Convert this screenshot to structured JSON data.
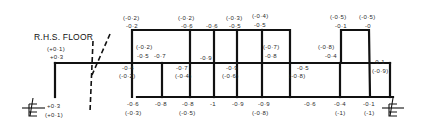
{
  "diagram": {
    "title": "R.H.S. FLOOR",
    "centerline_symbol": "℄",
    "centerline_icons": [
      "left-centerline",
      "right-centerline"
    ],
    "labels": {
      "left_top_paren": "(+0·1)",
      "left_top": "+0·3",
      "left_bottom": "+0·3",
      "left_bottom_paren": "(+0·1)",
      "bay1_top_paren": "(-0·2)",
      "bay1_top": "-0·2",
      "bay1_inner_paren": "(-0·2)",
      "bay1_inner_a": "-0·5",
      "bay1_inner_b": "-0·7",
      "bay1_mid": "-0·4",
      "bay1_mid_paren": "(-0·2)",
      "bay2_top_paren": "(-0·2)",
      "bay2_top": "-0·6",
      "bay2_mid": "-0·7",
      "bay2_mid_paren": "(-0·4)",
      "bay2_inner": "-0·9",
      "bay3_top_paren": "(-0·3)",
      "bay3_top": "-0·5",
      "bay3_top_b": "-0·6",
      "bay3_mid": "-0·9",
      "bay3_mid_paren": "(-0·6)",
      "bay4_top_paren": "(-0·4)",
      "bay4_top": "-0·5",
      "bay4_step_paren": "(-0·7)",
      "bay4_step": "-0·8",
      "bay5_mid": "-0·5",
      "bay5_mid_paren": "(-0·8)",
      "bay6_step_paren": "(-0·8)",
      "bay6_step": "-0·4",
      "bay7_top_paren_a": "(-0·5)",
      "bay7_top_a": "-0·1",
      "bay7_top_paren_b": "(-0·5)",
      "bay7_top_b": "-0",
      "right_mid": "-0·1",
      "right_mid_paren": "(-0·9)",
      "bot_1": "-0·6",
      "bot_1_paren": "(-0·3)",
      "bot_2": "-0·8",
      "bot_3": "-0·8",
      "bot_3_paren": "(-0·5)",
      "bot_4": "-1",
      "bot_5": "-0·9",
      "bot_6": "-0·9",
      "bot_6_paren": "(-0·8)",
      "bot_7": "-0·6",
      "bot_8": "-0·4",
      "bot_8_paren": "(-1)",
      "bot_9": "-0·1",
      "bot_9_paren": "(-1)"
    }
  }
}
